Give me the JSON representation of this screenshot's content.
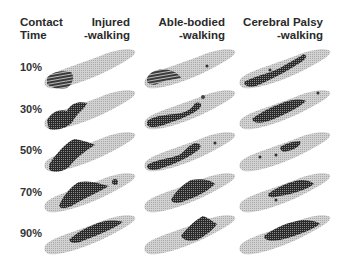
{
  "figure": {
    "type": "plantar-pressure-grid",
    "corner_header": {
      "line1": "Contact",
      "line2": "Time"
    },
    "columns": [
      {
        "line1": "Injured",
        "line2": "-walking"
      },
      {
        "line1": "Able-bodied",
        "line2": "-walking"
      },
      {
        "line1": "Cerebral Palsy",
        "line2": "-walking"
      }
    ],
    "rows": [
      "10%",
      "30%",
      "50%",
      "70%",
      "90%"
    ],
    "colors": {
      "foot_base": "#c8c8c8",
      "pressure_high": "#1e1e1e",
      "pressure_mid": "#555555",
      "background": "#ffffff"
    }
  }
}
